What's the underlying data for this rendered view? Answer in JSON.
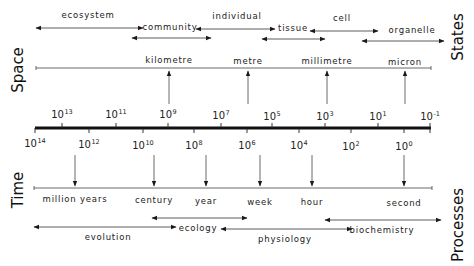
{
  "diagram": {
    "axis_side_labels": {
      "space": "Space",
      "states": "States",
      "time": "Time",
      "processes": "Processes"
    },
    "scale_exponents_upper": [
      {
        "base": "10",
        "exp": "13",
        "x": 62
      },
      {
        "base": "10",
        "exp": "11",
        "x": 116
      },
      {
        "base": "10",
        "exp": "9",
        "x": 168
      },
      {
        "base": "10",
        "exp": "7",
        "x": 221
      },
      {
        "base": "10",
        "exp": "5",
        "x": 272
      },
      {
        "base": "10",
        "exp": "3",
        "x": 325
      },
      {
        "base": "10",
        "exp": "1",
        "x": 378
      },
      {
        "base": "10",
        "exp": "-1",
        "x": 430
      }
    ],
    "scale_exponents_lower": [
      {
        "base": "10",
        "exp": "14",
        "x": 35
      },
      {
        "base": "10",
        "exp": "12",
        "x": 89
      },
      {
        "base": "10",
        "exp": "10",
        "x": 143
      },
      {
        "base": "10",
        "exp": "8",
        "x": 194
      },
      {
        "base": "10",
        "exp": "6",
        "x": 247
      },
      {
        "base": "10",
        "exp": "4",
        "x": 299
      },
      {
        "base": "10",
        "exp": "2",
        "x": 351
      },
      {
        "base": "10",
        "exp": "0",
        "x": 404
      }
    ],
    "space_units": [
      {
        "label": "kilometre",
        "x": 169
      },
      {
        "label": "metre",
        "x": 248
      },
      {
        "label": "millimetre",
        "x": 327
      },
      {
        "label": "micron",
        "x": 405
      }
    ],
    "time_units": [
      {
        "label": "million years",
        "x": 75
      },
      {
        "label": "century",
        "x": 154
      },
      {
        "label": "year",
        "x": 206
      },
      {
        "label": "week",
        "x": 260
      },
      {
        "label": "hour",
        "x": 312
      },
      {
        "label": "second",
        "x": 404
      }
    ],
    "states": [
      {
        "label": "ecosystem",
        "label_x": 88,
        "label_y": 13
      },
      {
        "label": "community",
        "label_x": 170,
        "label_y": 24
      },
      {
        "label": "individual",
        "label_x": 237,
        "label_y": 15
      },
      {
        "label": "tissue",
        "label_x": 293,
        "label_y": 26
      },
      {
        "label": "cell",
        "label_x": 342,
        "label_y": 17
      },
      {
        "label": "organelle",
        "label_x": 412,
        "label_y": 28
      }
    ],
    "processes": [
      {
        "label": "evolution",
        "label_x": 108,
        "label_y": 234
      },
      {
        "label": "ecology",
        "label_x": 198,
        "label_y": 223
      },
      {
        "label": "physiology",
        "label_x": 285,
        "label_y": 236
      },
      {
        "label": "biochemistry",
        "label_x": 382,
        "label_y": 224
      }
    ],
    "colors": {
      "ink": "#1a1a1a",
      "thin_line": "#333333",
      "background": "#ffffff"
    }
  }
}
